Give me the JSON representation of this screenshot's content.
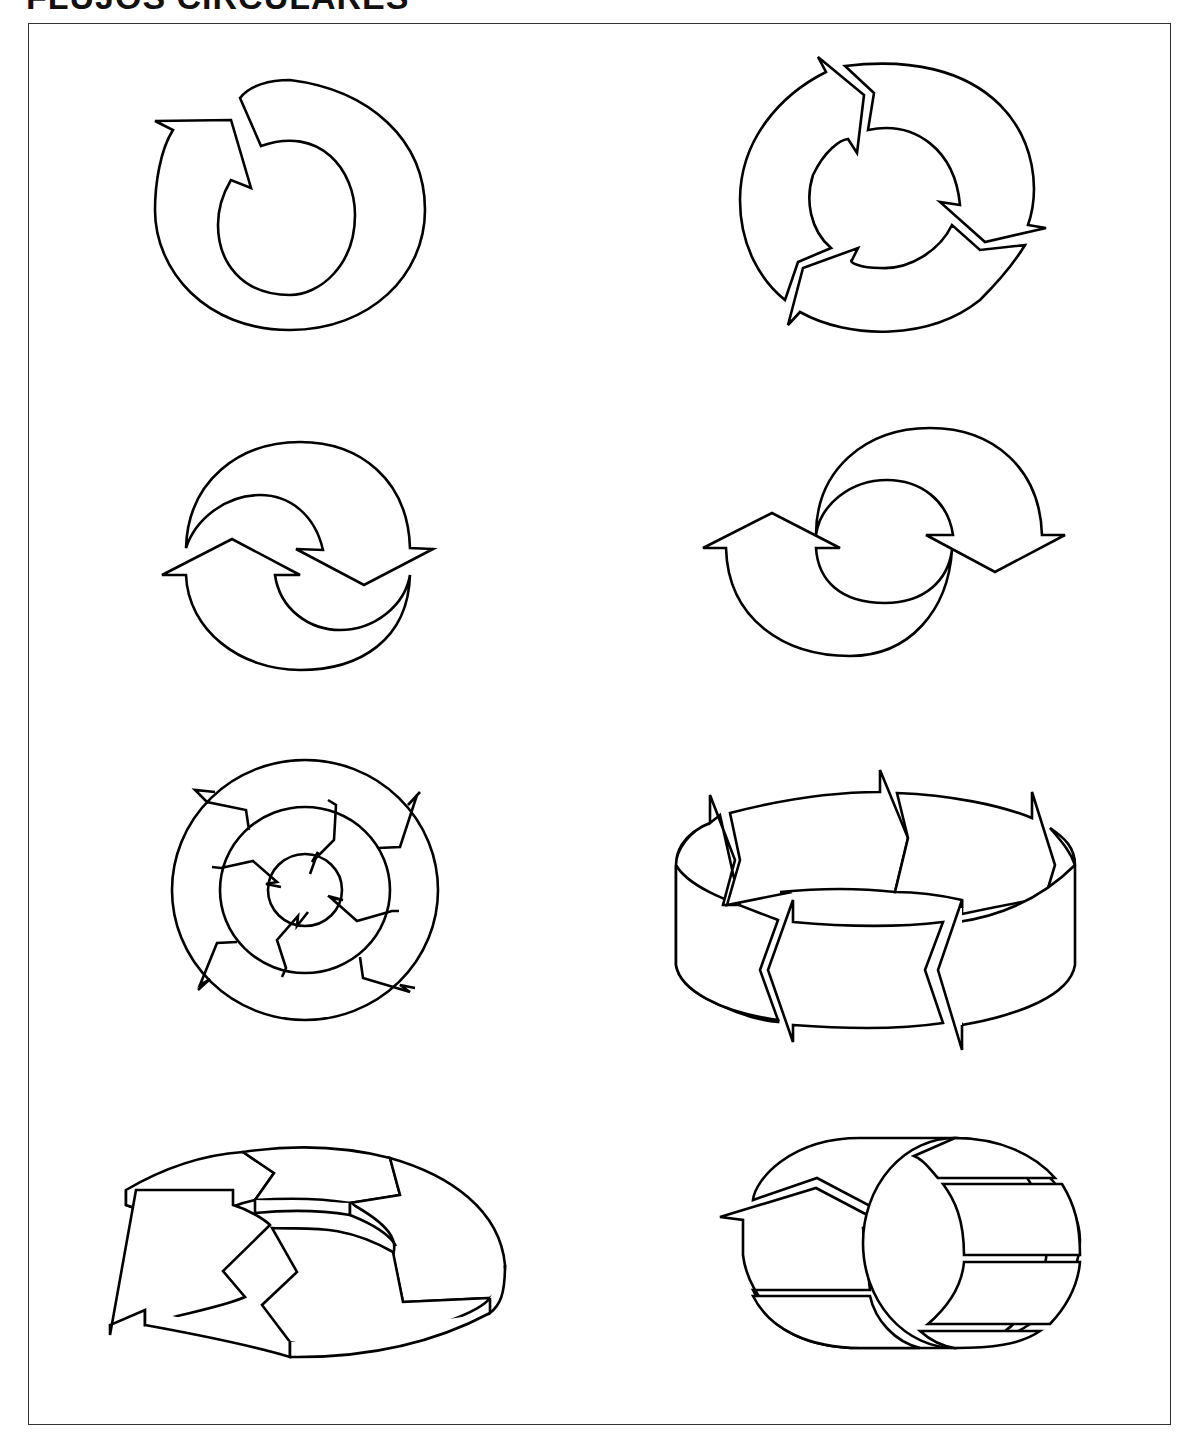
{
  "page": {
    "title": "FLUJOS CIRCULARES",
    "frame_border_color": "#333333",
    "stroke_color": "#000000",
    "background": "#ffffff"
  },
  "figures": [
    {
      "id": 1,
      "name": "single-arrow-ring",
      "description": "Ring with one arrow returning on itself",
      "row": 1,
      "col": 1
    },
    {
      "id": 2,
      "name": "three-arrow-ring",
      "description": "Ring divided into three chasing arrows",
      "row": 1,
      "col": 2
    },
    {
      "id": 3,
      "name": "two-arrow-swirl",
      "description": "Two interlocking crescent arrows (compact)",
      "row": 2,
      "col": 1
    },
    {
      "id": 4,
      "name": "two-arrow-swirl-wide",
      "description": "Two interlocking crescent arrows (wide)",
      "row": 2,
      "col": 2
    },
    {
      "id": 5,
      "name": "concentric-arrow-rings",
      "description": "Three concentric rings of four arrows each",
      "row": 3,
      "col": 1
    },
    {
      "id": 6,
      "name": "arrow-band-cylinder",
      "description": "3D band of four zigzag arrows around a cylinder",
      "row": 3,
      "col": 2
    },
    {
      "id": 7,
      "name": "3d-segmented-ring",
      "description": "Flat 3D ring of arrow segments with open end",
      "row": 4,
      "col": 1
    },
    {
      "id": 8,
      "name": "arrow-tube",
      "description": "Tube/cylinder with arrow wrapping over it",
      "row": 4,
      "col": 2
    }
  ]
}
